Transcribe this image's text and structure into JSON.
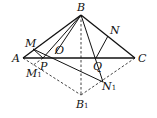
{
  "diagram": {
    "type": "geometry",
    "points": {
      "A": {
        "label": "A",
        "x": 23,
        "y": 58
      },
      "B": {
        "label": "B",
        "x": 81,
        "y": 15
      },
      "C": {
        "label": "C",
        "x": 135,
        "y": 58
      },
      "B1": {
        "label": "B",
        "sub": "1",
        "x": 81,
        "y": 95
      },
      "M": {
        "label": "M",
        "x": 33,
        "y": 49
      },
      "N": {
        "label": "N",
        "x": 108,
        "y": 36
      },
      "O": {
        "label": "O",
        "x": 55,
        "y": 52
      },
      "P": {
        "label": "P",
        "x": 43,
        "y": 58
      },
      "Q": {
        "label": "Q",
        "x": 96,
        "y": 58
      },
      "M1": {
        "label": "M",
        "sub": "1",
        "x": 32,
        "y": 66
      },
      "N1": {
        "label": "N",
        "sub": "1",
        "x": 103,
        "y": 82
      }
    },
    "solid_segments": [
      [
        "A",
        "B"
      ],
      [
        "B",
        "C"
      ],
      [
        "A",
        "C"
      ],
      [
        "B",
        "P"
      ],
      [
        "B",
        "O"
      ],
      [
        "B",
        "Q"
      ],
      [
        "Q",
        "N"
      ],
      [
        "M",
        "N1"
      ],
      [
        "B",
        "N1"
      ]
    ],
    "dashed_segments": [
      [
        "A",
        "B1"
      ],
      [
        "B1",
        "C"
      ],
      [
        "B",
        "B1"
      ],
      [
        "M",
        "M1"
      ],
      [
        "P",
        "M1"
      ]
    ]
  }
}
